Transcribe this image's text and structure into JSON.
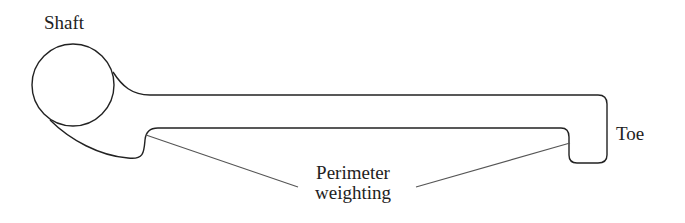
{
  "diagram": {
    "labels": {
      "shaft": "Shaft",
      "toe": "Toe",
      "perimeter_line1": "Perimeter",
      "perimeter_line2": "weighting"
    },
    "colors": {
      "stroke": "#222222",
      "leader": "#555555",
      "background": "#ffffff"
    }
  }
}
